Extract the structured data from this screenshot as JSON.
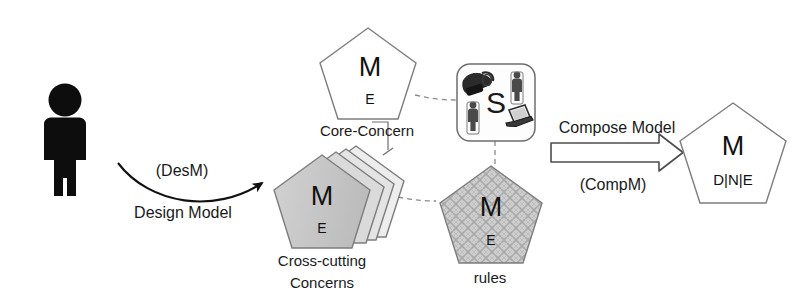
{
  "diagram": {
    "canvas": {
      "width": 811,
      "height": 308,
      "background": "#ffffff"
    },
    "actor": {
      "name": "designer-person",
      "color": "#0d0d0d"
    },
    "design_arrow": {
      "label_above": "(DesM)",
      "label_below": "Design Model",
      "style": "curved-arrow"
    },
    "compose_arrow": {
      "label_above": "Compose Model",
      "label_below": "(CompM)",
      "style": "hollow-block-arrow"
    },
    "nodes": {
      "core_concern": {
        "caption": "Core-Concern",
        "glyph_top": "M",
        "glyph_bottom": "E",
        "fill": "#ffffff",
        "stroke": "#7d7d7d"
      },
      "cross_cutting": {
        "caption_line1": "Cross-cutting",
        "caption_line2": "Concerns",
        "glyph_top": "M",
        "glyph_bottom": "E",
        "fill": "#c4c4c4",
        "stack_count": 4,
        "stroke": "#7d7d7d"
      },
      "rules": {
        "caption": "rules",
        "glyph_top": "M",
        "glyph_bottom": "E",
        "fill": "#c9c9c9",
        "pattern": "cross-hatch-weave",
        "stroke": "#7d7d7d"
      },
      "composed_model": {
        "caption": "",
        "glyph_top": "M",
        "glyph_bottom": "D|N|E",
        "fill": "#ffffff",
        "stroke": "#7d7d7d"
      },
      "composition_spec": {
        "glyph_center": "S",
        "fill": "#fcfcfc",
        "stroke": "#6e6e6e",
        "icons": [
          {
            "name": "telephone-icon",
            "position": "top-left"
          },
          {
            "name": "person-icon",
            "position": "top-right"
          },
          {
            "name": "person-icon",
            "position": "bottom-left"
          },
          {
            "name": "laptop-icon",
            "position": "bottom-right"
          }
        ]
      }
    },
    "connectors": [
      {
        "name": "core-concern-to-spec",
        "style": "dashed"
      },
      {
        "name": "spec-to-rules",
        "style": "dashed"
      },
      {
        "name": "cross-cutting-to-rules",
        "style": "dashed"
      },
      {
        "name": "cross-cutting-to-core-concern",
        "style": "solid-thin"
      }
    ]
  }
}
